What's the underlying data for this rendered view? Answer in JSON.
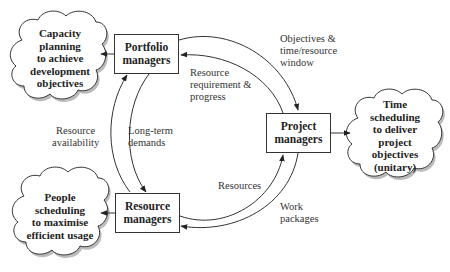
{
  "diagram": {
    "nodes": {
      "portfolio": {
        "label": "Portfolio managers",
        "line1": "Portfolio",
        "line2": "managers"
      },
      "project": {
        "label": "Project managers",
        "line1": "Project",
        "line2": "managers"
      },
      "resource": {
        "label": "Resource managers",
        "line1": "Resource",
        "line2": "managers"
      }
    },
    "clouds": {
      "capacity": {
        "lines": [
          "Capacity",
          "planning",
          "to achieve",
          "development",
          "objectives"
        ]
      },
      "time": {
        "lines": [
          "Time",
          "scheduling",
          "to deliver",
          "project",
          "objectives",
          "(unitary)"
        ]
      },
      "people": {
        "lines": [
          "People",
          "scheduling",
          "to maximise",
          "efficient usage"
        ]
      }
    },
    "edges": {
      "objectives_window": {
        "lines": [
          "Objectives &",
          "time/resource",
          "window"
        ]
      },
      "requirement_progress": {
        "lines": [
          "Resource",
          "requirement &",
          "progress"
        ]
      },
      "resource_availability": {
        "lines": [
          "Resource",
          "availability"
        ]
      },
      "long_term_demands": {
        "lines": [
          "Long-term",
          "demands"
        ]
      },
      "resources": {
        "lines": [
          "Resources"
        ]
      },
      "work_packages": {
        "lines": [
          "Work",
          "packages"
        ]
      }
    }
  }
}
